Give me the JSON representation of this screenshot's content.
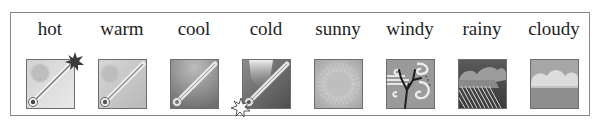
{
  "weather_icons": [
    {
      "label": "hot",
      "icon": "thermometer-hot-icon"
    },
    {
      "label": "warm",
      "icon": "thermometer-warm-icon"
    },
    {
      "label": "cool",
      "icon": "thermometer-cool-icon"
    },
    {
      "label": "cold",
      "icon": "thermometer-cold-icon"
    },
    {
      "label": "sunny",
      "icon": "sun-icon"
    },
    {
      "label": "windy",
      "icon": "wind-tree-icon"
    },
    {
      "label": "rainy",
      "icon": "rain-cloud-icon"
    },
    {
      "label": "cloudy",
      "icon": "cloud-icon"
    }
  ]
}
